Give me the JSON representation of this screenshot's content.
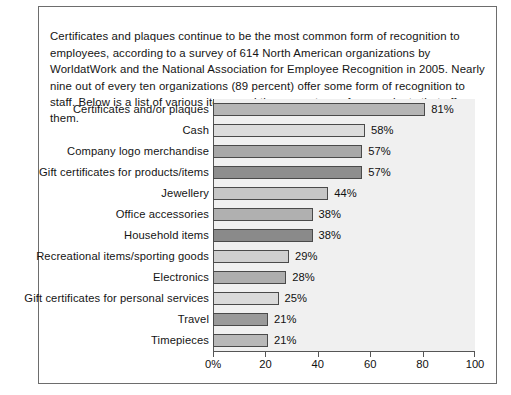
{
  "intro": {
    "text": "Certificates and plaques continue to be the most common form of recognition to employees, according to a survey of 614 North American organizations by WorldatWork and the National Association for Employee Recognition in 2005. Nearly nine out of every ten organizations (89 percent) offer some form of recognition to staff. Below is a list of various items and the percentage of respondents that offer them."
  },
  "chart_data": {
    "type": "bar",
    "orientation": "horizontal",
    "title": "",
    "xlabel": "",
    "ylabel": "",
    "xlim": [
      0,
      100
    ],
    "grid": false,
    "legend": null,
    "axis_ticks": [
      "0%",
      "20",
      "40",
      "60",
      "80",
      "100"
    ],
    "axis_tick_values": [
      0,
      20,
      40,
      60,
      80,
      100
    ],
    "categories": [
      "Certificates and/or plaques",
      "Cash",
      "Company logo merchandise",
      "Gift certificates for products/items",
      "Jewellery",
      "Office accessories",
      "Household items",
      "Recreational items/sporting goods",
      "Electronics",
      "Gift certificates for personal services",
      "Travel",
      "Timepieces"
    ],
    "values": [
      81,
      58,
      57,
      57,
      44,
      38,
      38,
      29,
      28,
      25,
      21,
      21
    ],
    "value_labels": [
      "81%",
      "58%",
      "57%",
      "57%",
      "44%",
      "38%",
      "38%",
      "29%",
      "28%",
      "25%",
      "21%",
      "21%"
    ],
    "bar_colors": [
      "#b5b5b5",
      "#dcdcdc",
      "#a8a8a8",
      "#8e8e8e",
      "#c6c6c6",
      "#b0b0b0",
      "#8a8a8a",
      "#cfcfcf",
      "#aeaeae",
      "#dadada",
      "#9a9a9a",
      "#b8b8b8"
    ]
  },
  "colors": {
    "plot_background": "#f0f0f0",
    "frame_border": "#6d6d6d",
    "axis": "#555555",
    "bar_outline": "#4a4a4a",
    "text": "#141414"
  }
}
